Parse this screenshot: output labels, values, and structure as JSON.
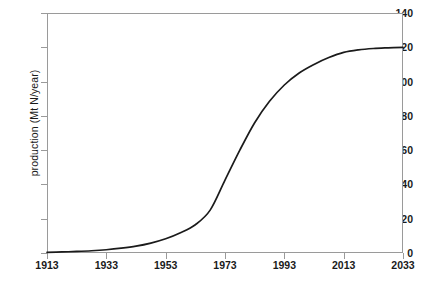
{
  "chart_data": {
    "type": "line",
    "title": "",
    "subtitle": "",
    "xlabel": "",
    "ylabel": "production (Mt N/year)",
    "xlim": [
      1913,
      2033
    ],
    "ylim": [
      0,
      140
    ],
    "grid": false,
    "legend": null,
    "x_ticks": [
      "1913",
      "1933",
      "1953",
      "1973",
      "1993",
      "2013",
      "2033"
    ],
    "y_ticks": [
      "0",
      "20",
      "40",
      "60",
      "80",
      "100",
      "120",
      "140"
    ],
    "x_tick_values": [
      1913,
      1933,
      1953,
      1973,
      1993,
      2013,
      2033
    ],
    "y_tick_values": [
      0,
      20,
      40,
      60,
      80,
      100,
      120,
      140
    ],
    "series": [
      {
        "name": "production",
        "color": "#1b1b1b",
        "x": [
          1913,
          1918,
          1923,
          1928,
          1933,
          1938,
          1943,
          1948,
          1953,
          1958,
          1963,
          1968,
          1973,
          1978,
          1983,
          1988,
          1993,
          1998,
          2003,
          2008,
          2013,
          2018,
          2023,
          2028,
          2033
        ],
        "values": [
          0.4,
          0.6,
          0.9,
          1.3,
          1.9,
          2.8,
          4.0,
          5.8,
          8.3,
          11.8,
          16.5,
          25.0,
          42.5,
          60.0,
          76.0,
          88.5,
          98.0,
          105.0,
          110.0,
          114.0,
          117.0,
          118.5,
          119.3,
          119.7,
          120.0
        ]
      }
    ]
  },
  "axes": {
    "y_label": "production (Mt N/year)"
  }
}
